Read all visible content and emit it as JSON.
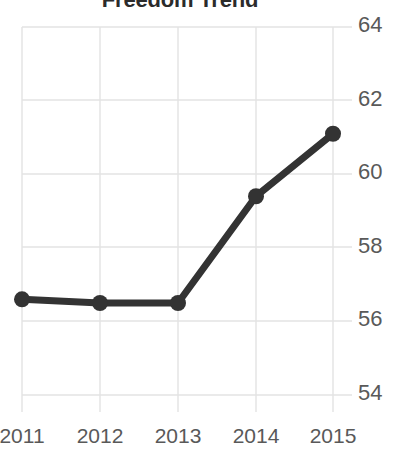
{
  "chart_data": {
    "type": "line",
    "title": "Freedom Trend",
    "xlabel": "",
    "ylabel": "",
    "categories": [
      "2011",
      "2012",
      "2013",
      "2014",
      "2015"
    ],
    "values": [
      56.6,
      56.5,
      56.5,
      59.4,
      61.1
    ],
    "series": [
      {
        "name": "Freedom Trend",
        "values": [
          56.6,
          56.5,
          56.5,
          59.4,
          61.1
        ],
        "color": "#333333",
        "marker": "circle"
      }
    ],
    "ylim": [
      54,
      64
    ],
    "yticks": [
      64,
      62,
      60,
      58,
      56,
      54
    ],
    "ytick_labels": [
      "64",
      "62",
      "60",
      "58",
      "56",
      "54"
    ],
    "xticks": [
      "2011",
      "2012",
      "2013",
      "2014",
      "2015"
    ],
    "grid": true,
    "grid_color": "#e3e3e3",
    "y_axis_position": "right",
    "legend": "none",
    "background": "#ffffff"
  },
  "colors": {
    "line": "#333333",
    "grid": "#e3e3e3",
    "tick_text": "#595959",
    "title_text": "#2b2b2b",
    "background": "#ffffff"
  }
}
